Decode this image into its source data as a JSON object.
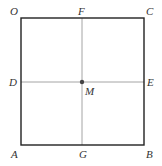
{
  "diagram": {
    "type": "geometry-figure",
    "colors": {
      "square_stroke": "#222222",
      "cross_stroke": "#9a9a9a",
      "point_fill": "#444444",
      "label": "#333333"
    },
    "square": {
      "vertices": [
        "O",
        "C",
        "B",
        "A"
      ],
      "top_left": [
        21,
        18
      ],
      "bottom_right": [
        144,
        145
      ]
    },
    "lines": [
      {
        "name": "DE",
        "from": "D",
        "to": "E",
        "orientation": "horizontal"
      },
      {
        "name": "FG",
        "from": "F",
        "to": "G",
        "orientation": "vertical"
      }
    ],
    "center_point": {
      "label": "M",
      "x": 82,
      "y": 82
    },
    "labels": {
      "O": "O",
      "F": "F",
      "C": "C",
      "D": "D",
      "E": "E",
      "M": "M",
      "A": "A",
      "G": "G",
      "B": "B"
    }
  }
}
